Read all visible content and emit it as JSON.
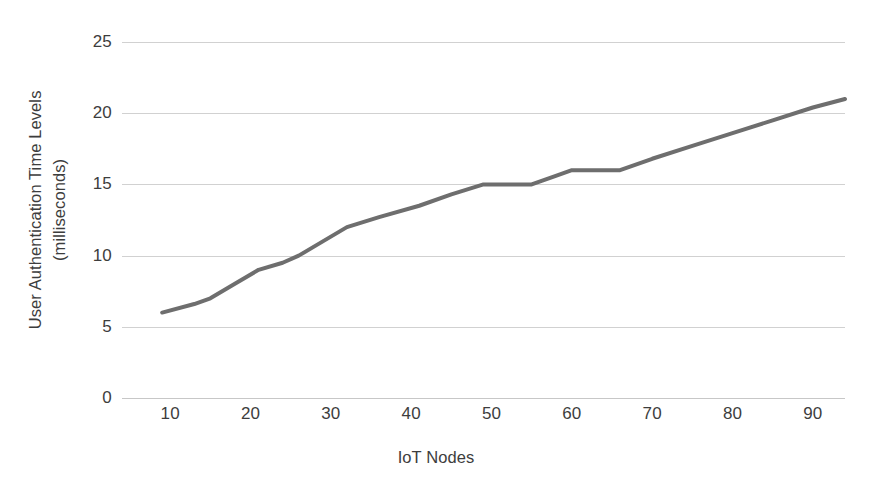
{
  "chart_data": {
    "type": "line",
    "title": "",
    "xlabel": "IoT Nodes",
    "ylabel": "User Authentication Time Levels (milliseconds)",
    "ylabel_line1": "User Authentication Time Levels",
    "ylabel_line2": "(milliseconds)",
    "xlim": [
      4,
      94
    ],
    "ylim": [
      0,
      25
    ],
    "grid": true,
    "legend": false,
    "legend_position": "none",
    "line_color": "#6e6e6e",
    "line_width_px": 4,
    "x_ticks": [
      10,
      20,
      30,
      40,
      50,
      60,
      70,
      80,
      90
    ],
    "y_ticks": [
      0,
      5,
      10,
      15,
      20,
      25
    ],
    "x_tick_labels": [
      "10",
      "20",
      "30",
      "40",
      "50",
      "60",
      "70",
      "80",
      "90"
    ],
    "y_tick_labels": [
      "0",
      "5",
      "10",
      "15",
      "20",
      "25"
    ],
    "series": [
      {
        "name": "User Authentication Time",
        "x": [
          9,
          13,
          15,
          18,
          21,
          24,
          26,
          29,
          32,
          36,
          41,
          45,
          49,
          52,
          55,
          58,
          60,
          63,
          66,
          70,
          75,
          80,
          85,
          90,
          94
        ],
        "values": [
          6,
          6.6,
          7,
          8,
          9,
          9.5,
          10,
          11,
          12,
          12.7,
          13.5,
          14.3,
          15,
          15,
          15,
          15.6,
          16,
          16,
          16,
          16.8,
          17.7,
          18.6,
          19.5,
          20.4,
          21
        ]
      }
    ]
  },
  "axes": {
    "y_title_line1": "User Authentication Time Levels",
    "y_title_line2": "(milliseconds)",
    "x_title": "IoT Nodes"
  }
}
